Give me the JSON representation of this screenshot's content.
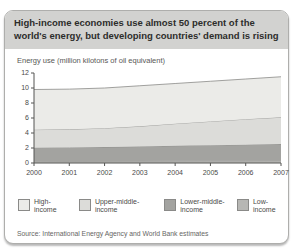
{
  "card": {
    "title": "High-income economies use almost 50 percent of the world's energy, but developing countries' demand is rising",
    "subtitle": "Energy use (million kilotons of oil equivalent)",
    "source": "Source: International Energy Agency and World Bank estimates"
  },
  "chart_data": {
    "type": "area",
    "stacked": true,
    "title": "Energy use (million kilotons of oil equivalent)",
    "x": [
      2000,
      2001,
      2002,
      2003,
      2004,
      2005,
      2006,
      2007
    ],
    "ylim": [
      0,
      12
    ],
    "yticks": [
      0,
      2,
      4,
      6,
      8,
      10,
      12
    ],
    "grid": false,
    "legend_position": "bottom",
    "axis_color": "#555553",
    "line_color": "#8a8a88",
    "series": [
      {
        "name": "Low-income",
        "legend_line1": "Low-",
        "legend_line2": "income",
        "color": "#b7b7b4",
        "values": [
          0.25,
          0.26,
          0.27,
          0.28,
          0.29,
          0.3,
          0.3,
          0.31
        ]
      },
      {
        "name": "Lower-middle-income",
        "legend_line1": "Lower-middle-",
        "legend_line2": "income",
        "color": "#a3a3a0",
        "values": [
          1.8,
          1.82,
          1.85,
          1.92,
          2.01,
          2.08,
          2.15,
          2.21
        ]
      },
      {
        "name": "Upper-middle-income",
        "legend_line1": "Upper-middle-",
        "legend_line2": "income",
        "color": "#dcdcd9",
        "values": [
          2.4,
          2.42,
          2.53,
          2.7,
          2.95,
          3.17,
          3.4,
          3.58
        ]
      },
      {
        "name": "High-income",
        "legend_line1": "High-",
        "legend_line2": "income",
        "color": "#ebebe8",
        "values": [
          5.35,
          5.35,
          5.35,
          5.4,
          5.35,
          5.35,
          5.35,
          5.4
        ]
      }
    ]
  }
}
